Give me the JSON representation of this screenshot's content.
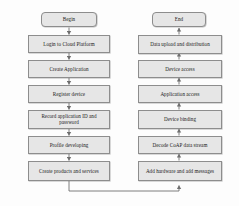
{
  "diagram": {
    "type": "flowchart",
    "orientation": "two-column; left column flows top-to-bottom, right column flows bottom-to-top",
    "colors": {
      "node_fill": "#e6e6e6",
      "node_border": "#8d8d8d",
      "connector": "#6f6f6f",
      "background": "#fdfdfd",
      "text": "#1a1a1a"
    },
    "left_column": {
      "nodes": [
        {
          "id": "begin",
          "label": "Begin",
          "shape": "rounded-terminator"
        },
        {
          "id": "login",
          "label": "Login to Cloud Platform",
          "shape": "rectangle"
        },
        {
          "id": "create-application",
          "label": "Create Application",
          "shape": "rectangle"
        },
        {
          "id": "register-device",
          "label": "Register device",
          "shape": "rectangle"
        },
        {
          "id": "record-credentials",
          "label": "Record application ID and password",
          "shape": "rectangle"
        },
        {
          "id": "profile-developing",
          "label": "Profile developing",
          "shape": "rectangle"
        },
        {
          "id": "create-products",
          "label": "Create products and services",
          "shape": "rectangle"
        }
      ]
    },
    "right_column": {
      "nodes": [
        {
          "id": "end",
          "label": "End",
          "shape": "rounded-terminator"
        },
        {
          "id": "data-upload",
          "label": "Data upload and distribution",
          "shape": "rectangle"
        },
        {
          "id": "device-access",
          "label": "Device access",
          "shape": "rectangle"
        },
        {
          "id": "application-access",
          "label": "Application access",
          "shape": "rectangle"
        },
        {
          "id": "device-binding",
          "label": "Device binding",
          "shape": "rectangle"
        },
        {
          "id": "decode-coap",
          "label": "Decode CoAP data stream",
          "shape": "rectangle"
        },
        {
          "id": "add-hardware",
          "label": "Add hardware and add messages",
          "shape": "rectangle"
        }
      ]
    },
    "edges": [
      {
        "from": "begin",
        "to": "login",
        "direction": "down"
      },
      {
        "from": "login",
        "to": "create-application",
        "direction": "down"
      },
      {
        "from": "create-application",
        "to": "register-device",
        "direction": "down"
      },
      {
        "from": "register-device",
        "to": "record-credentials",
        "direction": "down"
      },
      {
        "from": "record-credentials",
        "to": "profile-developing",
        "direction": "down"
      },
      {
        "from": "profile-developing",
        "to": "create-products",
        "direction": "down"
      },
      {
        "from": "create-products",
        "to": "add-hardware",
        "direction": "down-right-up",
        "style": "elbow"
      },
      {
        "from": "add-hardware",
        "to": "decode-coap",
        "direction": "up"
      },
      {
        "from": "decode-coap",
        "to": "device-binding",
        "direction": "up"
      },
      {
        "from": "device-binding",
        "to": "application-access",
        "direction": "up"
      },
      {
        "from": "application-access",
        "to": "device-access",
        "direction": "up"
      },
      {
        "from": "device-access",
        "to": "data-upload",
        "direction": "up"
      },
      {
        "from": "data-upload",
        "to": "end",
        "direction": "up"
      }
    ]
  }
}
